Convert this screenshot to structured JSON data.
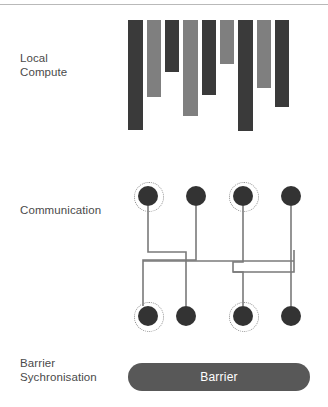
{
  "diagram": {
    "background_color": "#ffffff",
    "top_rule_color": "#b9b9b9"
  },
  "rows": [
    {
      "id": "local-compute",
      "label": "Local\nCompute"
    },
    {
      "id": "communication",
      "label": "Communication"
    },
    {
      "id": "barrier",
      "label": "Barrier\nSychronisation"
    }
  ],
  "local_compute": {
    "label": "Local\nCompute",
    "colors": {
      "dark": "#3a3a3a",
      "light": "#7f7f7f"
    },
    "bars": [
      {
        "index": 1,
        "x": 128,
        "y": 20,
        "width": 15,
        "height": 110,
        "color": "#3a3a3a",
        "shade": "dark"
      },
      {
        "index": 2,
        "x": 147,
        "y": 20,
        "width": 14,
        "height": 77,
        "color": "#7f7f7f",
        "shade": "light"
      },
      {
        "index": 3,
        "x": 165,
        "y": 20,
        "width": 14,
        "height": 52,
        "color": "#3a3a3a",
        "shade": "dark"
      },
      {
        "index": 4,
        "x": 183,
        "y": 20,
        "width": 15,
        "height": 96,
        "color": "#7f7f7f",
        "shade": "light"
      },
      {
        "index": 5,
        "x": 202,
        "y": 20,
        "width": 14,
        "height": 75,
        "color": "#3a3a3a",
        "shade": "dark"
      },
      {
        "index": 6,
        "x": 220,
        "y": 20,
        "width": 14,
        "height": 44,
        "color": "#7f7f7f",
        "shade": "light"
      },
      {
        "index": 7,
        "x": 238,
        "y": 20,
        "width": 15,
        "height": 111,
        "color": "#3a3a3a",
        "shade": "dark"
      },
      {
        "index": 8,
        "x": 257,
        "y": 20,
        "width": 14,
        "height": 68,
        "color": "#7f7f7f",
        "shade": "light"
      },
      {
        "index": 9,
        "x": 275,
        "y": 20,
        "width": 14,
        "height": 87,
        "color": "#3a3a3a",
        "shade": "dark"
      }
    ]
  },
  "communication": {
    "label": "Communication",
    "node_color": "#333333",
    "ring_color": "#8a8a8a",
    "wire_color": "#7a7a7a",
    "node_radius": 10,
    "ring_radius": 14,
    "top_nodes": [
      {
        "id": "t1",
        "cx": 148,
        "cy": 196,
        "ring": true
      },
      {
        "id": "t2",
        "cx": 196,
        "cy": 196,
        "ring": false
      },
      {
        "id": "t3",
        "cx": 243,
        "cy": 196,
        "ring": true
      },
      {
        "id": "t4",
        "cx": 291,
        "cy": 196,
        "ring": false
      }
    ],
    "bottom_nodes": [
      {
        "id": "b1",
        "cx": 148,
        "cy": 316,
        "ring": true
      },
      {
        "id": "b2",
        "cx": 186,
        "cy": 316,
        "ring": false
      },
      {
        "id": "b3",
        "cx": 243,
        "cy": 316,
        "ring": true
      },
      {
        "id": "b4",
        "cx": 291,
        "cy": 316,
        "ring": false
      }
    ],
    "wires": [
      {
        "id": "w1",
        "from": "t1",
        "to": "b2",
        "points": "148,206 148,252 186,252 186,306"
      },
      {
        "id": "w2",
        "from": "t2",
        "to": "b1",
        "points": "196,206 196,260 143,260 143,262 143,306"
      },
      {
        "id": "w3",
        "from": "t3",
        "to": "b3",
        "points": "243,206 243,262 233,262 233,272 243,272 243,306"
      },
      {
        "id": "w4",
        "from": "t4",
        "to": "b4",
        "points": "291,206 291,250 291,306"
      },
      {
        "id": "w5",
        "from": "bus-left",
        "to": "bus-right",
        "points": "143,261 294,261"
      },
      {
        "id": "w6",
        "from": "branch",
        "to": "b3",
        "points": "294,250 294,272 233,272"
      }
    ]
  },
  "barrier": {
    "label": "Barrier\nSychronisation",
    "bar_text": "Barrier",
    "bar_color": "#585858",
    "text_color": "#ffffff",
    "x": 128,
    "y": 363,
    "width": 182,
    "height": 28
  }
}
